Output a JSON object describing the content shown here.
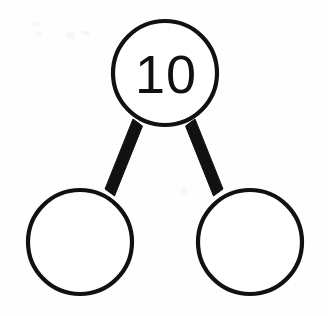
{
  "diagram": {
    "type": "number-bond",
    "background_color": "#fefefe",
    "stroke_color": "#111111",
    "fill_color": "#ffffff",
    "whole": {
      "label": "10",
      "name": "whole-node",
      "cx": 165,
      "cy": 73,
      "r": 52,
      "filled": true
    },
    "parts": [
      {
        "label": "",
        "name": "part-node-left",
        "cx": 80,
        "cy": 242,
        "r": 52,
        "filled": false
      },
      {
        "label": "",
        "name": "part-node-right",
        "cx": 250,
        "cy": 242,
        "r": 52,
        "filled": false
      }
    ],
    "links": [
      {
        "name": "bond-link-left",
        "from": "whole-node",
        "to": "part-node-left",
        "thickness": 11
      },
      {
        "name": "bond-link-right",
        "from": "whole-node",
        "to": "part-node-right",
        "thickness": 11
      }
    ]
  }
}
